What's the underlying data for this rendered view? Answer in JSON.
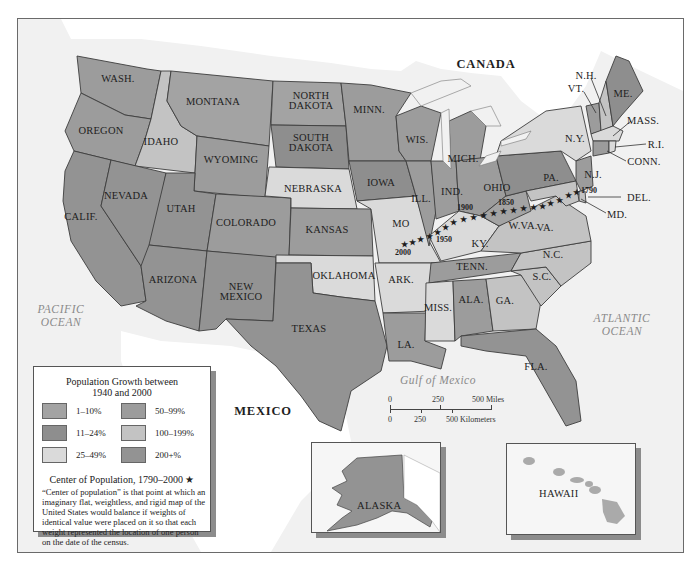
{
  "map": {
    "title": "Population Growth between 1940 and 2000",
    "colors": {
      "1-10": "#a3a3a3",
      "11-24": "#8e8e8e",
      "25-49": "#dadada",
      "50-99": "#9c9c9c",
      "100-199": "#c3c3c3",
      "200+": "#939393",
      "water": "#f1f1f1",
      "foreign_land": "#ffffff"
    },
    "labels": {
      "canada": "CANADA",
      "mexico": "MEXICO",
      "pacific_1": "PACIFIC",
      "pacific_2": "OCEAN",
      "atlantic_1": "ATLANTIC",
      "atlantic_2": "OCEAN",
      "gulf": "Gulf of Mexico"
    },
    "states": [
      {
        "abbr": "WASH.",
        "category": "50-99"
      },
      {
        "abbr": "OREGON",
        "category": "50-99"
      },
      {
        "abbr": "CALIF.",
        "category": "200+"
      },
      {
        "abbr": "IDAHO",
        "category": "100-199"
      },
      {
        "abbr": "NEVADA",
        "category": "200+"
      },
      {
        "abbr": "MONTANA",
        "category": "1-10"
      },
      {
        "abbr": "WYOMING",
        "category": "50-99"
      },
      {
        "abbr": "UTAH",
        "category": "200+"
      },
      {
        "abbr": "COLORADO",
        "category": "50-99"
      },
      {
        "abbr": "ARIZONA",
        "category": "200+"
      },
      {
        "abbr": "NEW MEXICO",
        "category": "200+"
      },
      {
        "abbr": "NORTH DAKOTA",
        "category": "1-10"
      },
      {
        "abbr": "SOUTH DAKOTA",
        "category": "11-24"
      },
      {
        "abbr": "NEBRASKA",
        "category": "25-49"
      },
      {
        "abbr": "KANSAS",
        "category": "50-99"
      },
      {
        "abbr": "OKLAHOMA",
        "category": "25-49"
      },
      {
        "abbr": "TEXAS",
        "category": "200+"
      },
      {
        "abbr": "MINN.",
        "category": "50-99"
      },
      {
        "abbr": "IOWA",
        "category": "11-24"
      },
      {
        "abbr": "MO",
        "category": "25-49"
      },
      {
        "abbr": "ARK.",
        "category": "25-49"
      },
      {
        "abbr": "LA.",
        "category": "50-99"
      },
      {
        "abbr": "WIS.",
        "category": "50-99"
      },
      {
        "abbr": "ILL.",
        "category": "50-99"
      },
      {
        "abbr": "MICH.",
        "category": "50-99"
      },
      {
        "abbr": "IND.",
        "category": "50-99"
      },
      {
        "abbr": "OHIO",
        "category": "50-99"
      },
      {
        "abbr": "KY.",
        "category": "25-49"
      },
      {
        "abbr": "TENN.",
        "category": "50-99"
      },
      {
        "abbr": "MISS.",
        "category": "25-49"
      },
      {
        "abbr": "ALA.",
        "category": "50-99"
      },
      {
        "abbr": "GA.",
        "category": "100-199"
      },
      {
        "abbr": "FLA.",
        "category": "200+"
      },
      {
        "abbr": "S.C.",
        "category": "100-199"
      },
      {
        "abbr": "N.C.",
        "category": "100-199"
      },
      {
        "abbr": "VA.",
        "category": "100-199"
      },
      {
        "abbr": "W.VA.",
        "category": "1-10"
      },
      {
        "abbr": "PA.",
        "category": "11-24"
      },
      {
        "abbr": "N.Y.",
        "category": "25-49"
      },
      {
        "abbr": "VT.",
        "category": "50-99"
      },
      {
        "abbr": "N.H.",
        "category": "100-199"
      },
      {
        "abbr": "ME.",
        "category": "11-24"
      },
      {
        "abbr": "MASS.",
        "category": "25-49"
      },
      {
        "abbr": "R.I.",
        "category": "25-49"
      },
      {
        "abbr": "CONN.",
        "category": "50-99"
      },
      {
        "abbr": "N.J.",
        "category": "50-99"
      },
      {
        "abbr": "DEL.",
        "category": "100-199"
      },
      {
        "abbr": "MD.",
        "category": "100-199"
      },
      {
        "abbr": "ALASKA",
        "category": "200+"
      },
      {
        "abbr": "HAWAII",
        "category": "100-199"
      }
    ],
    "center_of_population": {
      "years_labeled": [
        "1790",
        "1850",
        "1900",
        "1950",
        "2000"
      ]
    }
  },
  "legend": {
    "title_line1": "Population Growth between",
    "title_line2": "1940 and 2000",
    "items": [
      {
        "label": "1–10%",
        "color": "#a3a3a3"
      },
      {
        "label": "11–24%",
        "color": "#8e8e8e"
      },
      {
        "label": "25–49%",
        "color": "#dadada"
      },
      {
        "label": "50–99%",
        "color": "#9c9c9c"
      },
      {
        "label": "100–199%",
        "color": "#c3c3c3"
      },
      {
        "label": "200+%",
        "color": "#939393"
      }
    ],
    "center_title": "Center of Population, 1790–2000",
    "center_star": "★",
    "center_description": "“Center of population” is that point at which an imaginary flat, weightless, and rigid map of the United States would balance if weights of identical value were placed on it so that each weight represented the location of one person on the date of the census."
  },
  "scale": {
    "miles_ticks": [
      "0",
      "250",
      "500 Miles"
    ],
    "km_ticks": [
      "0",
      "250",
      "500 Kilometers"
    ]
  },
  "insets": {
    "alaska": "ALASKA",
    "hawaii": "HAWAII"
  }
}
